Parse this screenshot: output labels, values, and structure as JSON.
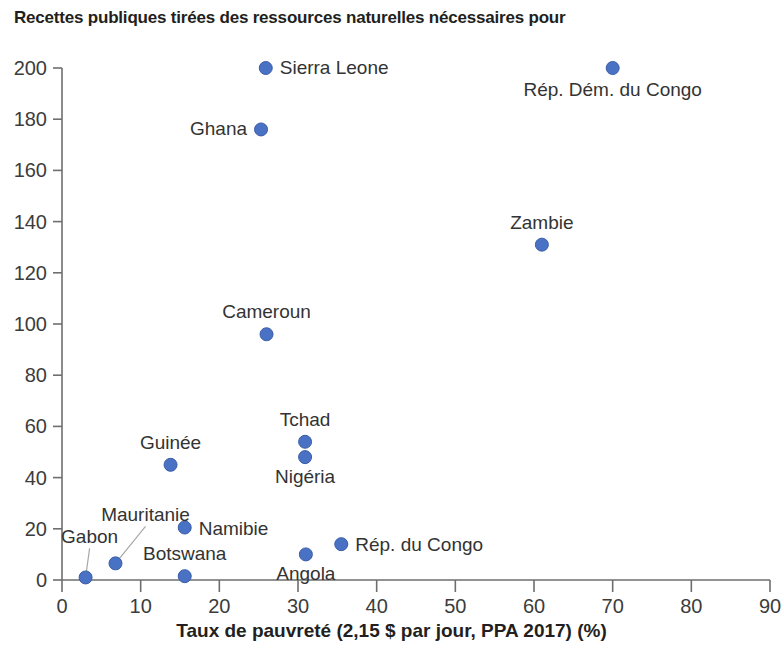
{
  "chart_data": {
    "type": "scatter",
    "title": "Recettes publiques tirées des ressources naturelles nécessaires pour",
    "xlabel": "Taux de pauvreté (2,15 $ par jour, PPA 2017) (%)",
    "ylabel": "",
    "xlim": [
      0,
      90
    ],
    "ylim": [
      0,
      200
    ],
    "xticks": [
      0,
      10,
      20,
      30,
      40,
      50,
      60,
      70,
      80,
      90
    ],
    "yticks": [
      0,
      20,
      40,
      60,
      80,
      100,
      120,
      140,
      160,
      180,
      200
    ],
    "xtick_labels": [
      "0",
      "10",
      "20",
      "30",
      "40",
      "50",
      "60",
      "70",
      "80",
      "90"
    ],
    "ytick_labels": [
      "0",
      "20",
      "40",
      "60",
      "80",
      "100",
      "120",
      "140",
      "160",
      "180",
      "200"
    ],
    "grid": false,
    "legend": null,
    "marker_color": "#4a72c4",
    "marker_edge_color": "#3a5ca8",
    "points": [
      {
        "name": "Sierra Leone",
        "x": 25.9,
        "y": 200,
        "label_dx": 14,
        "label_dy": 6,
        "label_anchor": "start",
        "leader": false
      },
      {
        "name": "Rép. Dém. du Congo",
        "x": 70.0,
        "y": 200,
        "label_dx": 0,
        "label_dy": 28,
        "label_anchor": "middle",
        "leader": false
      },
      {
        "name": "Ghana",
        "x": 25.3,
        "y": 176,
        "label_dx": -14,
        "label_dy": 6,
        "label_anchor": "end",
        "leader": false
      },
      {
        "name": "Zambie",
        "x": 61.0,
        "y": 131,
        "label_dx": 0,
        "label_dy": -16,
        "label_anchor": "middle",
        "leader": false
      },
      {
        "name": "Cameroun",
        "x": 26.0,
        "y": 96,
        "label_dx": 0,
        "label_dy": -16,
        "label_anchor": "middle",
        "leader": false
      },
      {
        "name": "Tchad",
        "x": 30.9,
        "y": 54,
        "label_dx": 0,
        "label_dy": -16,
        "label_anchor": "middle",
        "leader": false
      },
      {
        "name": "Nigéria",
        "x": 30.9,
        "y": 48,
        "label_dx": 0,
        "label_dy": 26,
        "label_anchor": "middle",
        "leader": false
      },
      {
        "name": "Guinée",
        "x": 13.8,
        "y": 45,
        "label_dx": 0,
        "label_dy": -16,
        "label_anchor": "middle",
        "leader": false
      },
      {
        "name": "Namibie",
        "x": 15.6,
        "y": 20.5,
        "label_dx": 14,
        "label_dy": 7,
        "label_anchor": "start",
        "leader": false
      },
      {
        "name": "Rép. du Congo",
        "x": 35.5,
        "y": 14,
        "label_dx": 14,
        "label_dy": 7,
        "label_anchor": "start",
        "leader": false
      },
      {
        "name": "Angola",
        "x": 31.0,
        "y": 10,
        "label_dx": 0,
        "label_dy": 26,
        "label_anchor": "middle",
        "leader": false
      },
      {
        "name": "Mauritanie",
        "x": 6.8,
        "y": 6.5,
        "label_dx": 30,
        "label_dy": -42,
        "label_anchor": "middle",
        "leader": true
      },
      {
        "name": "Botswana",
        "x": 15.6,
        "y": 1.5,
        "label_dx": 0,
        "label_dy": -16,
        "label_anchor": "middle",
        "leader": false
      },
      {
        "name": "Gabon",
        "x": 3.0,
        "y": 1.0,
        "label_dx": 4,
        "label_dy": -34,
        "label_anchor": "middle",
        "leader": true
      }
    ]
  },
  "axis_titles": {
    "x": "Taux de pauvreté (2,15 $ par jour, PPA 2017) (%)"
  }
}
